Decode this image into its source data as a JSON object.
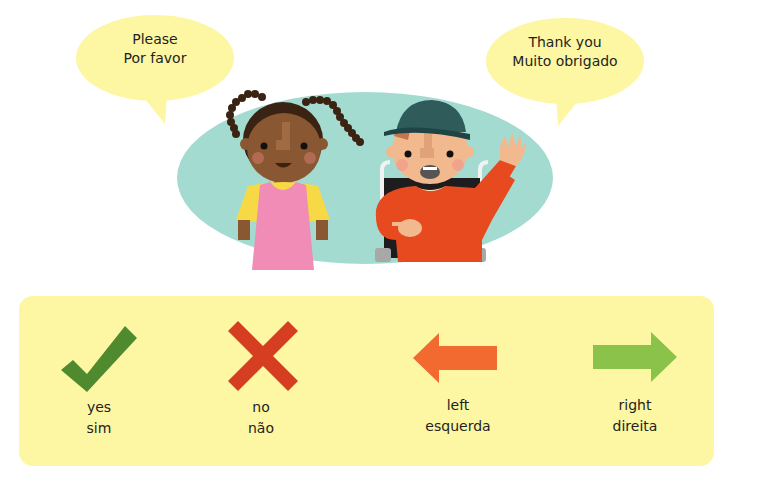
{
  "speech_bubbles": [
    {
      "line1": "Please",
      "line2": "Por favor"
    },
    {
      "line1": "Thank you",
      "line2": "Muito obrigado"
    }
  ],
  "vocab": [
    {
      "icon": "check-icon",
      "english": "yes",
      "portuguese": "sim",
      "color": "#4f8a2e"
    },
    {
      "icon": "cross-icon",
      "english": "no",
      "portuguese": "não",
      "color": "#d63e22"
    },
    {
      "icon": "arrow-left-icon",
      "english": "left",
      "portuguese": "esquerda",
      "color": "#f26a30"
    },
    {
      "icon": "arrow-right-icon",
      "english": "right",
      "portuguese": "direita",
      "color": "#8bc34a"
    }
  ],
  "colors": {
    "bubble": "#fdf6a3",
    "oval": "#a3dbd1",
    "panel": "#fdf6a3"
  }
}
